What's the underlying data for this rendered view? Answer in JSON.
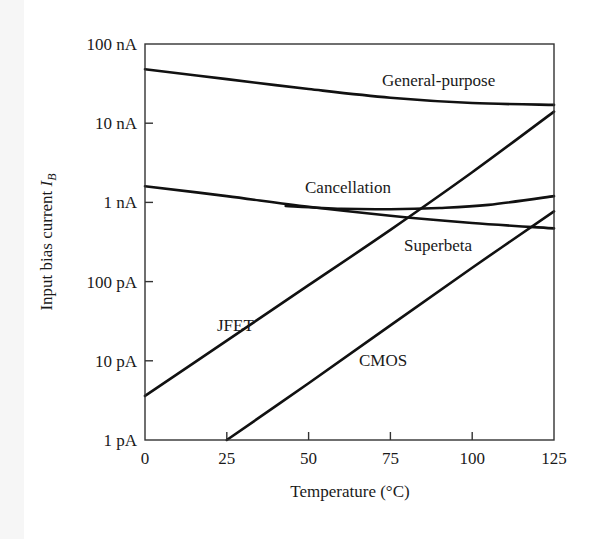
{
  "chart_data": {
    "type": "line",
    "title": "",
    "xlabel": "Temperature (°C)",
    "ylabel": "Input bias current I_B",
    "ylabel_main": "Input bias current ",
    "ylabel_symbol": "I",
    "ylabel_subscript": "B",
    "xlim": [
      0,
      125
    ],
    "ylim_amps": [
      1e-12,
      1e-07
    ],
    "yscale": "log",
    "grid": false,
    "legend": "inline labels",
    "x_ticks": [
      "0",
      "25",
      "50",
      "75",
      "100",
      "125"
    ],
    "x_tick_values": [
      0,
      25,
      50,
      75,
      100,
      125
    ],
    "y_ticks": [
      "1 pA",
      "10 pA",
      "100 pA",
      "1 nA",
      "10 nA",
      "100 nA"
    ],
    "y_tick_values_amps": [
      1e-12,
      1e-11,
      1e-10,
      1e-09,
      1e-08,
      1e-07
    ],
    "series": [
      {
        "name": "General-purpose",
        "label": "General-purpose",
        "x": [
          0,
          25,
          50,
          75,
          100,
          125
        ],
        "values_amps": [
          4.8e-08,
          3.6e-08,
          2.7e-08,
          2.1e-08,
          1.8e-08,
          1.7e-08
        ]
      },
      {
        "name": "Superbeta",
        "label": "Superbeta",
        "x": [
          0,
          25,
          50,
          75,
          100,
          125
        ],
        "values_amps": [
          1.6e-09,
          1.2e-09,
          8.8e-10,
          6.8e-10,
          5.5e-10,
          4.7e-10
        ]
      },
      {
        "name": "Cancellation",
        "label": "Cancellation",
        "x": [
          43,
          60,
          75,
          90,
          105,
          125
        ],
        "values_amps": [
          9e-10,
          8.3e-10,
          8.2e-10,
          8.5e-10,
          9.3e-10,
          1.2e-09
        ]
      },
      {
        "name": "JFET",
        "label": "JFET",
        "x": [
          0,
          25,
          50,
          75,
          100,
          125
        ],
        "values_amps": [
          3.6e-12,
          1.8e-11,
          9e-11,
          4.5e-10,
          2.4e-09,
          1.4e-08
        ]
      },
      {
        "name": "CMOS",
        "label": "CMOS",
        "x": [
          25,
          50,
          75,
          100,
          125
        ],
        "values_amps": [
          1e-12,
          5.2e-12,
          2.8e-11,
          1.5e-10,
          7.7e-10
        ]
      }
    ]
  },
  "labels": {
    "general_purpose": "General-purpose",
    "cancellation": "Cancellation",
    "superbeta": "Superbeta",
    "jfet": "JFET",
    "cmos": "CMOS"
  }
}
